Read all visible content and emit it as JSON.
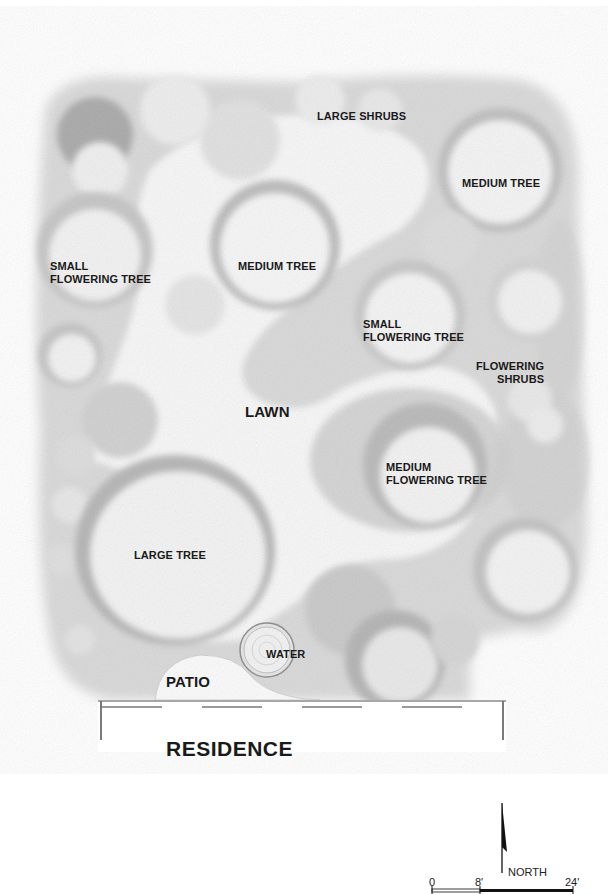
{
  "labels": {
    "large_shrubs": "LARGE SHRUBS",
    "medium_tree_ne": "MEDIUM TREE",
    "small_flowering_tree_w": "SMALL\nFLOWERING TREE",
    "medium_tree_center": "MEDIUM TREE",
    "small_flowering_tree_e": "SMALL\nFLOWERING TREE",
    "flowering_shrubs": "FLOWERING\nSHRUBS",
    "lawn": "LAWN",
    "medium_flowering_tree": "MEDIUM\nFLOWERING TREE",
    "large_tree": "LARGE TREE",
    "water": "WATER",
    "patio": "PATIO",
    "residence": "RESIDENCE"
  },
  "north_arrow": {
    "label": "NORTH"
  },
  "scale_bar": {
    "ticks": [
      "0",
      "8'",
      "24'"
    ],
    "units": "feet"
  },
  "colors": {
    "ink": "#1a1a1a",
    "foliage_dark": "#9a9a9a",
    "foliage_mid": "#c8c8c8",
    "foliage_light": "#ececec",
    "lawn": "#f6f6f6",
    "paper": "#ffffff"
  }
}
